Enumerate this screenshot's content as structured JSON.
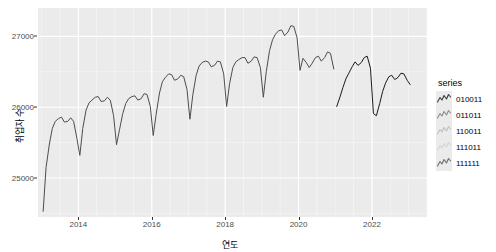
{
  "chart_data": {
    "type": "line",
    "title": "",
    "xlabel": "연도",
    "ylabel": "취업자 수",
    "xlim": [
      2012.9,
      2023.5
    ],
    "ylim": [
      24450,
      27400
    ],
    "xticks": [
      2014,
      2016,
      2018,
      2020,
      2022
    ],
    "xticklabels": [
      "2014",
      "2016",
      "2018",
      "2020",
      "2022"
    ],
    "yticks": [
      25000,
      26000,
      27000
    ],
    "yticklabels": [
      "25000",
      "26000",
      "27000"
    ],
    "grid": true,
    "grid_color": "#FFFFFF",
    "panel_background": "#EBEBEB",
    "legend": {
      "title": "series",
      "position": "right",
      "entries": [
        {
          "label": "010011",
          "color": "#3B3B3B"
        },
        {
          "label": "011011",
          "color": "#8C8C8C"
        },
        {
          "label": "110011",
          "color": "#BFBFBF"
        },
        {
          "label": "111011",
          "color": "#D4D4D4"
        },
        {
          "label": "111111",
          "color": "#6E6E6E"
        }
      ]
    },
    "series": [
      {
        "name": "observed",
        "color": "#4D4D4D",
        "x": [
          2013.04,
          2013.12,
          2013.21,
          2013.29,
          2013.37,
          2013.46,
          2013.54,
          2013.62,
          2013.71,
          2013.79,
          2013.87,
          2013.96,
          2014.04,
          2014.12,
          2014.21,
          2014.29,
          2014.37,
          2014.46,
          2014.54,
          2014.62,
          2014.71,
          2014.79,
          2014.87,
          2014.96,
          2015.04,
          2015.12,
          2015.21,
          2015.29,
          2015.37,
          2015.46,
          2015.54,
          2015.62,
          2015.71,
          2015.79,
          2015.87,
          2015.96,
          2016.04,
          2016.12,
          2016.21,
          2016.29,
          2016.37,
          2016.46,
          2016.54,
          2016.62,
          2016.71,
          2016.79,
          2016.87,
          2016.96,
          2017.04,
          2017.12,
          2017.21,
          2017.29,
          2017.37,
          2017.46,
          2017.54,
          2017.62,
          2017.71,
          2017.79,
          2017.87,
          2017.96,
          2018.04,
          2018.12,
          2018.21,
          2018.29,
          2018.37,
          2018.46,
          2018.54,
          2018.62,
          2018.71,
          2018.79,
          2018.87,
          2018.96,
          2019.04,
          2019.12,
          2019.21,
          2019.29,
          2019.37,
          2019.46,
          2019.54,
          2019.62,
          2019.71,
          2019.79,
          2019.87,
          2019.96,
          2020.04,
          2020.12,
          2020.21,
          2020.29,
          2020.37,
          2020.46,
          2020.54,
          2020.62,
          2020.71,
          2020.79,
          2020.87,
          2020.96
        ],
        "y": [
          24530,
          25150,
          25480,
          25700,
          25800,
          25840,
          25860,
          25790,
          25800,
          25850,
          25800,
          25560,
          25320,
          25700,
          25960,
          26060,
          26100,
          26140,
          26150,
          26080,
          26090,
          26140,
          26100,
          25880,
          25470,
          25680,
          25910,
          26050,
          26120,
          26150,
          26160,
          26100,
          26120,
          26190,
          26180,
          26010,
          25600,
          25900,
          26200,
          26360,
          26420,
          26470,
          26460,
          26380,
          26400,
          26450,
          26430,
          26250,
          25830,
          26180,
          26450,
          26580,
          26630,
          26650,
          26640,
          26570,
          26590,
          26650,
          26640,
          26470,
          26010,
          26330,
          26560,
          26640,
          26670,
          26700,
          26700,
          26620,
          26650,
          26710,
          26700,
          26560,
          26140,
          26500,
          26800,
          26950,
          27030,
          27080,
          27090,
          27010,
          27060,
          27150,
          27140,
          26980,
          26520,
          26690,
          26630,
          26560,
          26620,
          26700,
          26720,
          26650,
          26700,
          26780,
          26760,
          26540
        ]
      },
      {
        "name": "forecast",
        "color": "#1A1A1A",
        "x": [
          2021.04,
          2021.12,
          2021.21,
          2021.29,
          2021.37,
          2021.46,
          2021.54,
          2021.62,
          2021.71,
          2021.79,
          2021.87,
          2021.96,
          2022.04,
          2022.12,
          2022.21,
          2022.29,
          2022.37,
          2022.46,
          2022.54,
          2022.62,
          2022.71,
          2022.79,
          2022.87,
          2022.96,
          2023.04
        ],
        "y": [
          26010,
          26130,
          26280,
          26400,
          26480,
          26570,
          26640,
          26590,
          26630,
          26700,
          26720,
          26550,
          25910,
          25880,
          26050,
          26220,
          26340,
          26430,
          26450,
          26390,
          26420,
          26480,
          26470,
          26380,
          26320
        ]
      }
    ]
  }
}
